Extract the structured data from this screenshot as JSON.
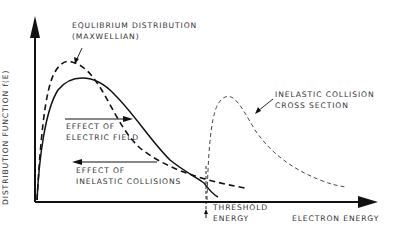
{
  "diagram": {
    "y_axis_label": "DISTRIBUTION FUNCTION f(E)",
    "x_axis_label": "ELECTRON ENERGY",
    "annotations": {
      "equilibrium": {
        "line1": "EQULIBRIUM DISTRIBUTION",
        "line2": "(MAXWELLIAN)"
      },
      "inelastic_cross_section": {
        "line1": "INELASTIC COLLISION",
        "line2": "CROSS SECTION"
      },
      "electric_field": {
        "line1": "EFFECT OF",
        "line2": "ELECTRIC FIELD"
      },
      "inelastic_collisions": {
        "line1": "EFFECT OF",
        "line2": "INELASTIC COLLISIONS"
      },
      "threshold": {
        "line1": "THRESHOLD",
        "line2": "ENERGY"
      }
    },
    "curves": [
      {
        "name": "Equilibrium distribution (Maxwellian)",
        "style": "dashed-thick"
      },
      {
        "name": "Distribution with electric field and inelastic collisions",
        "style": "solid"
      },
      {
        "name": "Inelastic collision cross section",
        "style": "dashed-thin"
      }
    ],
    "colors": {
      "ink": "#111111",
      "text": "#333333"
    }
  }
}
